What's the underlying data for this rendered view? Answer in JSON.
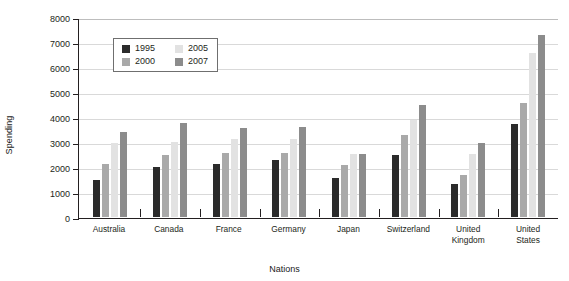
{
  "chart_data": {
    "type": "bar",
    "title": "",
    "xlabel": "Nations",
    "ylabel": "Spending",
    "ylim": [
      0,
      8000
    ],
    "ytick_step": 1000,
    "yticks": [
      "8000",
      "7000",
      "6000",
      "5000",
      "4000",
      "3000",
      "2000",
      "1000",
      "0"
    ],
    "grid": true,
    "legend_position": "upper-left-inside",
    "categories": [
      "Australia",
      "Canada",
      "France",
      "Germany",
      "Japan",
      "Switzerland",
      "United Kingdom",
      "United States"
    ],
    "series": [
      {
        "name": "1995",
        "color": "#2b2b2b",
        "values": [
          1450,
          2000,
          2100,
          2250,
          1550,
          2450,
          1300,
          3700
        ]
      },
      {
        "name": "2000",
        "color": "#a9a9a9",
        "values": [
          2100,
          2450,
          2550,
          2550,
          2050,
          3250,
          1650,
          4550
        ]
      },
      {
        "name": "2005",
        "color": "#e2e2e2",
        "values": [
          2950,
          3000,
          3100,
          3100,
          2500,
          3850,
          2500,
          6550
        ]
      },
      {
        "name": "2007",
        "color": "#8c8c8c",
        "values": [
          3400,
          3750,
          3550,
          3580,
          2500,
          4450,
          2950,
          7250
        ]
      }
    ]
  },
  "axes": {
    "y_title": "Spending",
    "x_title": "Nations"
  },
  "colors": {
    "axis": "#231f20",
    "gridline": "#d9d9d9",
    "legend_border": "#6f6f6f",
    "background": "#ffffff"
  }
}
